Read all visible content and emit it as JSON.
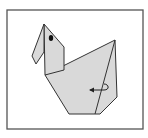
{
  "diagram": {
    "step_description": "Fold the tail flap behind along the crease",
    "colors": {
      "background": "#ffffff",
      "frame": "#555555",
      "paper_fill": "#d9d9d9",
      "outline": "#333333",
      "eye": "#111111",
      "arrow": "#222222"
    },
    "frame": {
      "x": 7,
      "y": 10,
      "width": 136,
      "height": 119
    },
    "shapes": {
      "beak": "44,24 32,56 36,64 44,52",
      "head_neck": "44,24 64,47 64,70 45,75",
      "body": "45,75 115,40 117,97 100,114 69,114",
      "crease": "115,40 95,114"
    },
    "eye": {
      "cx": 51,
      "cy": 38,
      "rx": 2.2,
      "ry": 3
    },
    "arrow": {
      "path": "M104,84 C109,84 110,90 104,90 L90,90",
      "head": "89,90 94,87.5 94,92.5",
      "meaning": "fold behind (mountain fold) arrow"
    }
  }
}
